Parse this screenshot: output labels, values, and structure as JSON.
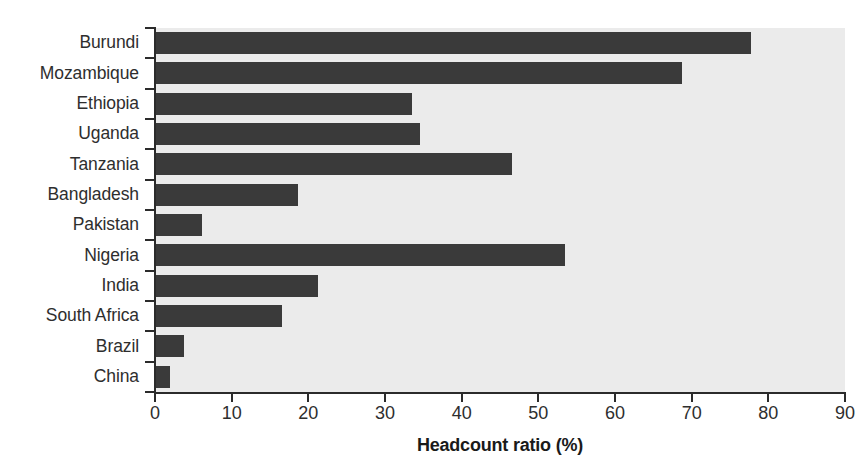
{
  "chart_data": {
    "type": "bar",
    "orientation": "horizontal",
    "title": "",
    "xlabel": "Headcount ratio (%)",
    "ylabel": "",
    "xlim": [
      0,
      90
    ],
    "xticks": [
      0,
      10,
      20,
      30,
      40,
      50,
      60,
      70,
      80,
      90
    ],
    "grid": false,
    "legend": null,
    "categories": [
      "Burundi",
      "Mozambique",
      "Ethiopia",
      "Uganda",
      "Tanzania",
      "Bangladesh",
      "Pakistan",
      "Nigeria",
      "India",
      "South Africa",
      "Brazil",
      "China"
    ],
    "values": [
      77.7,
      68.7,
      33.5,
      34.6,
      46.6,
      18.6,
      6.1,
      53.5,
      21.2,
      16.6,
      3.8,
      1.9
    ],
    "bar_color": "#3a3a3a",
    "plot_background": "#ebebeb",
    "axis_color": "#2b2b2b",
    "text_color": "#2e2e2e"
  }
}
